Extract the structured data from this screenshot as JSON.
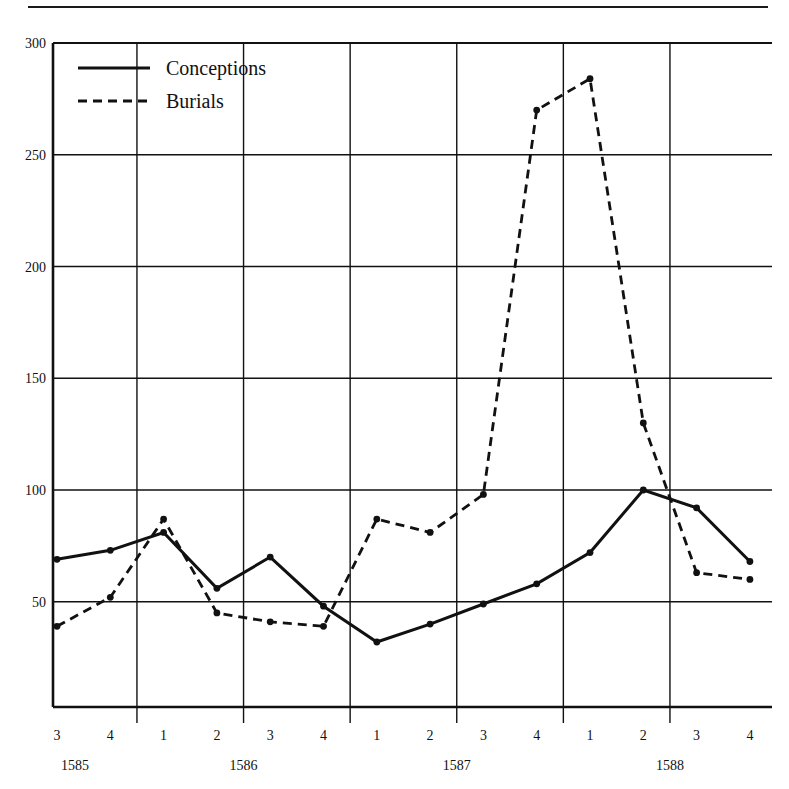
{
  "chart_data": {
    "type": "line",
    "title": "",
    "xlabel": "",
    "ylabel": "",
    "ylim": [
      0,
      300
    ],
    "yticks": [
      50,
      100,
      150,
      200,
      250,
      300
    ],
    "ytick_labels": [
      "50",
      "100",
      "150",
      "200",
      "250",
      "300"
    ],
    "grid": true,
    "legend_position": "top-left",
    "x": [
      "3",
      "4",
      "1",
      "2",
      "3",
      "4",
      "1",
      "2",
      "3",
      "4",
      "1",
      "2",
      "3",
      "4"
    ],
    "categories": [
      "1585 Q3",
      "1585 Q4",
      "1586 Q1",
      "1586 Q2",
      "1586 Q3",
      "1586 Q4",
      "1587 Q1",
      "1587 Q2",
      "1587 Q3",
      "1587 Q4",
      "1588 Q1",
      "1588 Q2",
      "1588 Q3",
      "1588 Q4"
    ],
    "year_groups": [
      {
        "label": "1585",
        "quarters": [
          "3",
          "4"
        ]
      },
      {
        "label": "1586",
        "quarters": [
          "1",
          "2",
          "3",
          "4"
        ]
      },
      {
        "label": "1587",
        "quarters": [
          "1",
          "2",
          "3",
          "4"
        ]
      },
      {
        "label": "1588",
        "quarters": [
          "1",
          "2",
          "3",
          "4"
        ]
      }
    ],
    "series": [
      {
        "name": "Conceptions",
        "style": "solid",
        "color": "#111111",
        "values": [
          69,
          73,
          81,
          56,
          70,
          48,
          32,
          40,
          49,
          58,
          72,
          100,
          92,
          68
        ]
      },
      {
        "name": "Burials",
        "style": "dashed",
        "color": "#111111",
        "values": [
          39,
          52,
          87,
          45,
          41,
          39,
          87,
          81,
          98,
          270,
          284,
          130,
          63,
          60
        ]
      }
    ]
  },
  "legend": {
    "items": [
      {
        "label": "Conceptions",
        "style": "solid"
      },
      {
        "label": "Burials",
        "style": "dashed"
      }
    ]
  }
}
